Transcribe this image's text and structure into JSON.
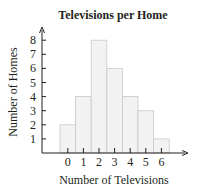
{
  "chart_data": {
    "type": "bar",
    "title": "Televisions per Home",
    "xlabel": "Number of Televisions",
    "ylabel": "Number of Homes",
    "categories": [
      "0",
      "1",
      "2",
      "3",
      "4",
      "5",
      "6"
    ],
    "values": [
      2,
      4,
      8,
      6,
      4,
      3,
      1
    ],
    "ylim": [
      0,
      8
    ],
    "yticks": [
      "1",
      "2",
      "3",
      "4",
      "5",
      "6",
      "7",
      "8"
    ],
    "grid": false,
    "legend": null,
    "histogram_style": true,
    "colors": {
      "bar_fill": "#f2f2f2",
      "bar_stroke": "#c8c8c8",
      "axis": "#231f20"
    }
  }
}
